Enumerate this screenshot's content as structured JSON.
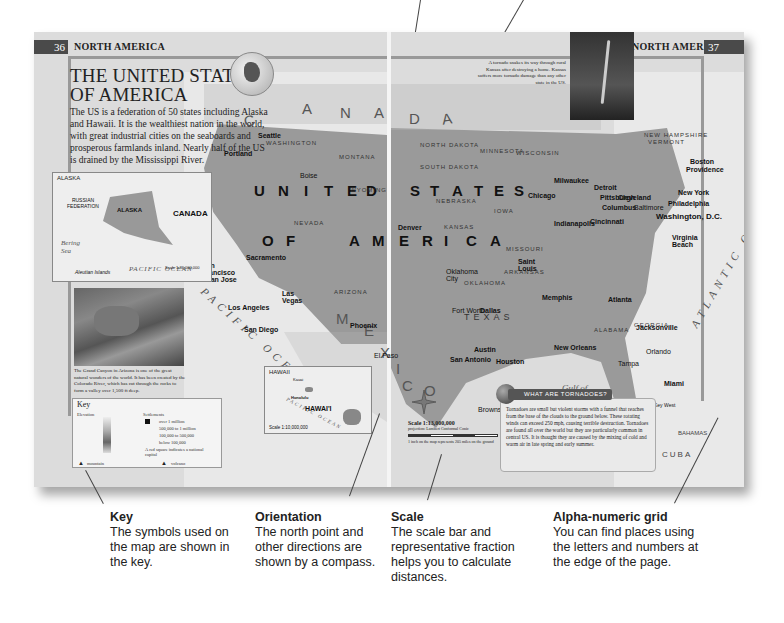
{
  "spread": {
    "left_page": {
      "page_number": "36",
      "running_head": "NORTH AMERICA",
      "title_line1": "THE UNITED STATES",
      "title_line2": "OF AMERICA",
      "intro": "The US is a federation of 50 states including Alaska and Hawaii. It is the wealthiest nation in the world, with great industrial cities on the seaboards and prosperous farmlands inland. Nearly half of the US is drained by the Mississippi River."
    },
    "right_page": {
      "page_number": "37",
      "running_head": "NORTH AMERICA"
    }
  },
  "map": {
    "country_letters": {
      "canada": [
        "C",
        "A",
        "N",
        "A",
        "D",
        "A"
      ],
      "united": [
        "U",
        "N",
        "I",
        "T",
        "E",
        "D"
      ],
      "states": [
        "S",
        "T",
        "A",
        "T",
        "E",
        "S"
      ],
      "of_america": [
        "O",
        "F",
        "A",
        "M",
        "E",
        "R",
        "I",
        "C",
        "A"
      ],
      "mexico": [
        "M",
        "E",
        "X",
        "I",
        "C",
        "O"
      ]
    },
    "oceans": {
      "pacific": "PACIFIC OCEAN",
      "atlantic": "ATLANTIC OCEAN",
      "gulf": "Gulf of Mexico"
    },
    "countries": {
      "cuba": "CUBA",
      "bahamas": "BAHAMAS"
    },
    "states": [
      "WASHINGTON",
      "OREGON",
      "IDAHO",
      "MONTANA",
      "WYOMING",
      "NEVADA",
      "UTAH",
      "ARIZONA",
      "NEW MEXICO",
      "NORTH DAKOTA",
      "SOUTH DAKOTA",
      "NEBRASKA",
      "KANSAS",
      "OKLAHOMA",
      "TEXAS",
      "MINNESOTA",
      "WISCONSIN",
      "IOWA",
      "MISSOURI",
      "ARKANSAS",
      "ILLINOIS",
      "INDIANA",
      "OHIO",
      "KENTUCKY",
      "ALABAMA",
      "GEORGIA",
      "PENNSYLVANIA",
      "NEW YORK",
      "VERMONT",
      "NEW HAMPSHIRE",
      "MASSACHUSETTS",
      "CONNECTICUT",
      "RHODE ISLAND",
      "NEW JERSEY",
      "DELAWARE",
      "MARYLAND"
    ],
    "cities": {
      "seattle": "Seattle",
      "portland": "Portland",
      "boise": "Boise",
      "sacramento": "Sacramento",
      "san_francisco": "San Francisco",
      "san_jose": "San Jose",
      "las_vegas": "Las Vegas",
      "los_angeles": "Los Angeles",
      "san_diego": "San Diego",
      "phoenix": "Phoenix",
      "el_paso": "El Paso",
      "denver": "Denver",
      "dallas": "Dallas",
      "fort_worth": "Fort Worth",
      "austin": "Austin",
      "san_antonio": "San Antonio",
      "houston": "Houston",
      "oklahoma_city": "Oklahoma City",
      "memphis": "Memphis",
      "saint_louis": "Saint Louis",
      "chicago": "Chicago",
      "milwaukee": "Milwaukee",
      "detroit": "Detroit",
      "cleveland": "Cleveland",
      "indianapolis": "Indianapolis",
      "cincinnati": "Cincinnati",
      "columbus": "Columbus",
      "pittsburgh": "Pittsburgh",
      "baltimore": "Baltimore",
      "washington": "Washington, D.C.",
      "philadelphia": "Philadelphia",
      "new_york": "New York",
      "boston": "Boston",
      "providence": "Providence",
      "virginia_beach": "Virginia Beach",
      "atlanta": "Atlanta",
      "jacksonville": "Jacksonville",
      "new_orleans": "New Orleans",
      "orlando": "Orlando",
      "tampa": "Tampa",
      "miami": "Miami",
      "key_west": "Key West",
      "brownsville": "Brownsville"
    }
  },
  "alaska_inset": {
    "title": "ALASKA",
    "labels": {
      "canada": "CANADA",
      "russia": "RUSSIAN FEDERATION",
      "bering": "Bering Sea",
      "pacific": "PACIFIC OCEAN",
      "aleutian": "Aleutian Islands",
      "alaska": "ALASKA"
    },
    "scale": "Scale 1:36,000,000"
  },
  "hawaii_inset": {
    "title": "HAWAII",
    "labels": {
      "kauai": "Kauai",
      "oahu": "O'ahu",
      "honolulu": "Honolulu",
      "molokai": "Molokai",
      "maui": "Maui",
      "hawaii": "HAWAI'I",
      "hawaii_sub": "(part of US)",
      "pacific": "PACIFIC OCEAN",
      "hilo": "Hilo"
    },
    "scale": "Scale 1:10,000,000"
  },
  "grand_canyon": {
    "caption": "The Grand Canyon in Arizona is one of the great natural wonders of the world. It has been created by the Colorado River, which has cut through the rocks to form a valley over 1,500 ft deep."
  },
  "tornado_photo": {
    "caption": "A tornado snakes its way through rural Kansas after destroying a home. Kansas suffers more tornado damage than any other state in the US."
  },
  "key": {
    "title": "Key",
    "elevation_label": "Elevation",
    "elevation_values": [
      "13,000 ft",
      "9,800 ft",
      "6,500 ft",
      "3,300 ft",
      "1,600 ft",
      "650 ft",
      "0",
      "-650 ft",
      "-6,500 ft",
      "-13,000 ft"
    ],
    "settlements_label": "Settlements",
    "settlements": [
      "over 1 million",
      "500,000 to 1 million",
      "100,000 to 500,000",
      "below 100,000"
    ],
    "capital_note": "A red square indicates a national capital",
    "mountain_label": "mountain",
    "volcano_label": "volcano"
  },
  "tornadoes_box": {
    "heading": "WHAT ARE TORNADOES?",
    "text": "Tornadoes are small but violent storms with a funnel that reaches from the base of the clouds to the ground below. These rotating winds can exceed 250 mph, causing terrible destruction. Tornadoes are found all over the world but they are particularly common in central US. It is thought they are caused by the mixing of cold and warm air in late spring and early summer."
  },
  "scale_block": {
    "title": "Scale 1:13,000,000",
    "projection": "projection: Lambert Conformal Conic",
    "ticks": [
      "0",
      "100",
      "200",
      "300",
      "400 miles"
    ],
    "note": "1 inch on the map represents 205 miles on the ground"
  },
  "compass": {
    "n": "N",
    "s": "S",
    "e": "E",
    "w": "W"
  },
  "annotations": [
    {
      "title": "Key",
      "text": "The symbols used on the map are shown in the key."
    },
    {
      "title": "Orientation",
      "text": "The north point and other directions are shown by a compass."
    },
    {
      "title": "Scale",
      "text": "The scale bar and representative fraction helps you to calculate distances."
    },
    {
      "title": "Alpha-numeric grid",
      "text": "You can find places using the letters and numbers at the edge of the page."
    }
  ]
}
